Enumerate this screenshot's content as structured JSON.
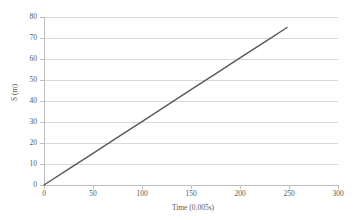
{
  "chart_data": {
    "type": "line",
    "title": "",
    "subtitle": "",
    "xlabel": "Time (0.005s)",
    "ylabel": "S (m)",
    "xlim": [
      0,
      300
    ],
    "ylim": [
      0,
      80
    ],
    "xticks": [
      0,
      50,
      100,
      150,
      200,
      250,
      300
    ],
    "yticks": [
      0,
      10,
      20,
      30,
      40,
      50,
      60,
      70,
      80
    ],
    "xtick_labels": [
      "0",
      "50",
      "100",
      "150",
      "200",
      "250",
      "300"
    ],
    "ytick_labels": [
      "0",
      "10",
      "20",
      "30",
      "40",
      "50",
      "60",
      "70",
      "80"
    ],
    "grid": {
      "horizontal": true,
      "vertical": false,
      "color": "#d9d9d9"
    },
    "legend": {
      "visible": false,
      "position": "none",
      "entries": []
    },
    "annotations": [],
    "series": [
      {
        "name": "Displacement",
        "color": "#595959",
        "line_width": 1.4,
        "markers": false,
        "x": [
          0,
          25,
          50,
          75,
          100,
          125,
          150,
          175,
          200,
          225,
          248
        ],
        "values": [
          0,
          7.6,
          15.1,
          22.7,
          30.2,
          37.8,
          45.4,
          52.9,
          60.5,
          68.0,
          75.0
        ]
      }
    ]
  },
  "axes": {
    "y_title": "S (m)",
    "x_title": "Time (0.005s)"
  }
}
